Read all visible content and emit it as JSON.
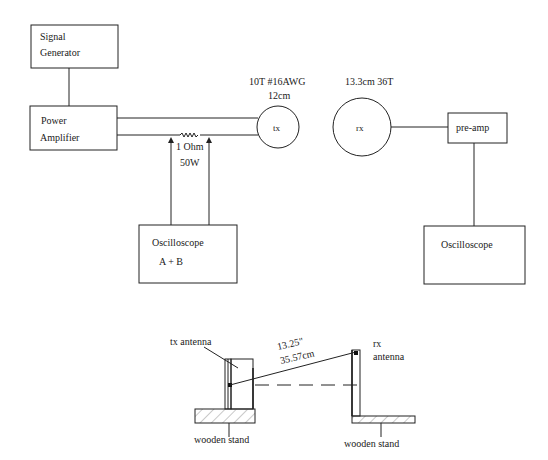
{
  "diagram": {
    "top": {
      "signal_generator": {
        "line1": "Signal",
        "line2": "Generator"
      },
      "power_amplifier": {
        "line1": "Power",
        "line2": "Amplifier"
      },
      "resistor": {
        "line1": "1 Ohm",
        "line2": "50W"
      },
      "oscilloscope_left": {
        "line1": "Oscilloscope",
        "line2": "A + B"
      },
      "tx_coil": {
        "label": "tx",
        "spec_line1": "10T #16AWG",
        "spec_line2": "12cm"
      },
      "rx_coil": {
        "label": "rx",
        "spec": "13.3cm 36T"
      },
      "preamp": {
        "label": "pre-amp"
      },
      "oscilloscope_right": {
        "line1": "Oscilloscope"
      }
    },
    "bottom": {
      "tx_antenna_label": "tx antenna",
      "rx_antenna_label_line1": "rx",
      "rx_antenna_label_line2": "antenna",
      "distance_line1": "13.25\"",
      "distance_line2": "35.57cm",
      "stand_left_label": "wooden stand",
      "stand_right_label": "wooden stand"
    }
  }
}
